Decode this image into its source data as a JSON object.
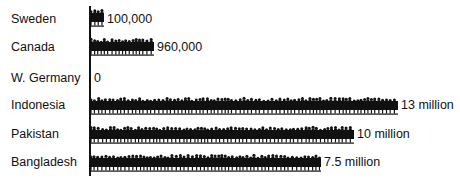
{
  "chart_data": {
    "type": "bar",
    "orientation": "horizontal",
    "style": "pictograph (crowd silhouettes)",
    "categories": [
      "Sweden",
      "Canada",
      "W. Germany",
      "Indonesia",
      "Pakistan",
      "Bangladesh"
    ],
    "values": [
      100000,
      960000,
      0,
      13000000,
      10000000,
      7500000
    ],
    "value_labels": [
      "100,000",
      "960,000",
      "0",
      "13 million",
      "10 million",
      "7.5 million"
    ],
    "title": "",
    "xlabel": "",
    "ylabel": "",
    "grid": false,
    "legend": null
  },
  "rows": [
    {
      "label": "Sweden",
      "value_label": "100,000",
      "label_top": 12,
      "bar_top": 7,
      "bar_width": 14,
      "value_left": 107
    },
    {
      "label": "Canada",
      "value_label": "960,000",
      "label_top": 40,
      "bar_top": 36,
      "bar_width": 64,
      "value_left": 157
    },
    {
      "label": "W. Germany",
      "value_label": "0",
      "label_top": 71,
      "bar_top": 68,
      "bar_width": 0,
      "value_left": 94
    },
    {
      "label": "Indonesia",
      "value_label": "13 million",
      "label_top": 98,
      "bar_top": 95,
      "bar_width": 308,
      "value_left": 401
    },
    {
      "label": "Pakistan",
      "value_label": "10 million",
      "label_top": 127,
      "bar_top": 124,
      "bar_width": 264,
      "value_left": 357
    },
    {
      "label": "Bangladesh",
      "value_label": "7.5 million",
      "label_top": 155,
      "bar_top": 152,
      "bar_width": 231,
      "value_left": 324
    }
  ],
  "colors": {
    "ink": "#111111",
    "background": "#ffffff"
  }
}
